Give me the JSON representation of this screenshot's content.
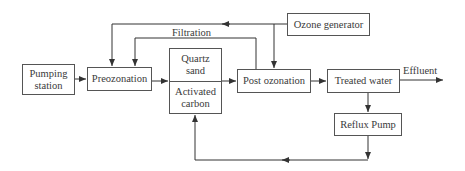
{
  "diagram": {
    "nodes": {
      "pumping_station": {
        "line1": "Pumping",
        "line2": "station"
      },
      "preozonation": {
        "label": "Preozonation"
      },
      "filter": {
        "top_line1": "Quartz",
        "top_line2": "sand",
        "bottom_line1": "Activated",
        "bottom_line2": "carbon"
      },
      "post_ozonation": {
        "label": "Post ozonation"
      },
      "treated_water": {
        "label": "Treated water"
      },
      "ozone_generator": {
        "label": "Ozone generator"
      },
      "reflux_pump": {
        "label": "Reflux Pump"
      }
    },
    "edge_labels": {
      "filtration": "Filtration",
      "effluent": "Effluent"
    },
    "edges": [
      {
        "from": "Pumping station",
        "to": "Preozonation"
      },
      {
        "from": "Preozonation",
        "to": "Quartz sand / Activated carbon"
      },
      {
        "from": "Quartz sand / Activated carbon",
        "to": "Post ozonation"
      },
      {
        "from": "Post ozonation",
        "to": "Treated water"
      },
      {
        "from": "Treated water",
        "to": "Effluent"
      },
      {
        "from": "Treated water",
        "to": "Reflux Pump"
      },
      {
        "from": "Reflux Pump",
        "to": "Quartz sand / Activated carbon"
      },
      {
        "from": "Ozone generator",
        "to": "Preozonation"
      },
      {
        "from": "Ozone generator",
        "to": "Post ozonation"
      },
      {
        "from": "Post ozonation",
        "to": "Preozonation",
        "label": "Filtration"
      }
    ],
    "colors": {
      "line": "#333333",
      "box_border": "#555555",
      "text": "#3a3a3a",
      "background": "#ffffff"
    }
  }
}
